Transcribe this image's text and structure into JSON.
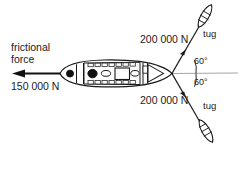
{
  "diagram": {
    "labels": {
      "frictional_force_line1": "frictional",
      "frictional_force_line2": "force",
      "frictional_force_value": "150 000 N",
      "tug_force_top": "200 000 N",
      "tug_force_bottom": "200 000 N",
      "tug_top": "tug",
      "tug_bottom": "tug",
      "angle_top": "60°",
      "angle_bottom": "60°"
    },
    "colors": {
      "ink": "#1a1a1a",
      "reference_line": "#9a9a9a",
      "background": "#ffffff",
      "fill": "#ffffff"
    }
  }
}
